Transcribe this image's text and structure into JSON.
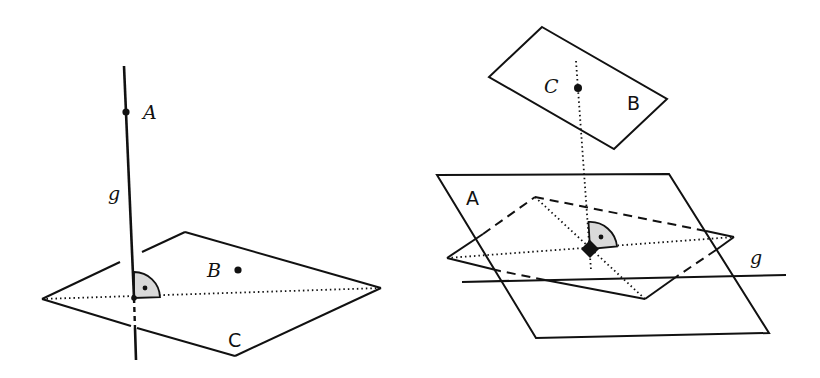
{
  "figures": [
    {
      "id": "left",
      "description": "Line g perpendicular to plane C",
      "labels": {
        "point_A": "A",
        "line_g": "g",
        "point_B": "B",
        "plane_C": "C"
      },
      "right_angle_marker": true
    },
    {
      "id": "right",
      "description": "Plane B with point C projected perpendicularly onto plane A, line g",
      "labels": {
        "point_C": "C",
        "plane_B": "B",
        "plane_A": "A",
        "line_g": "g"
      },
      "right_angle_marker": true,
      "foot_marker": "filled-diamond"
    }
  ],
  "colors": {
    "stroke": "#111111",
    "angle_fill": "#d9d9d9",
    "background": "#ffffff"
  }
}
